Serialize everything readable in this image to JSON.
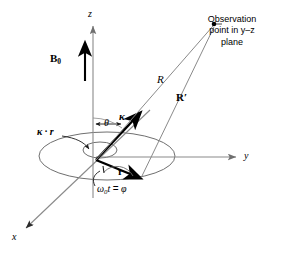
{
  "figure": {
    "background": "#ffffff",
    "ink": "#000000",
    "thin_line_color": "#7a7a7a",
    "width": 284,
    "height": 253
  },
  "axes": [
    {
      "name": "z-axis",
      "label": "z",
      "direction": "up",
      "tip": [
        93,
        22
      ]
    },
    {
      "name": "y-axis",
      "label": "y",
      "direction": "right",
      "tip": [
        238,
        157
      ]
    },
    {
      "name": "x-axis",
      "label": "x",
      "direction": "down-left",
      "tip": [
        24,
        230
      ]
    }
  ],
  "vectors": [
    {
      "name": "B0",
      "label": "B",
      "subscript": "0",
      "style": "bold",
      "description": "static magnetic field along z"
    },
    {
      "name": "kappa",
      "label": "κ",
      "style": "bold-italic",
      "description": "wave vector at angle theta from z"
    },
    {
      "name": "r",
      "label": "r",
      "style": "bold",
      "description": "position vector of charge in x-y plane"
    },
    {
      "name": "R",
      "label": "R",
      "style": "italic",
      "description": "distance to observation point"
    },
    {
      "name": "Rprime",
      "label": "R′",
      "style": "bold",
      "description": "vector to observation point"
    }
  ],
  "angles": [
    {
      "name": "theta",
      "label": "θ",
      "between": "z-axis and kappa"
    },
    {
      "name": "phi",
      "label": "ω",
      "subscript": "0",
      "var": "t",
      "equals": "=",
      "value": "φ",
      "text": "ω0t = φ",
      "between": "x-axis and r"
    }
  ],
  "annotations": [
    {
      "name": "kappa-dot-r",
      "label": "κ · r",
      "description": "phase term leader pointing to inner arc at origin"
    }
  ],
  "observation_point": {
    "name": "observation-point",
    "marker": [
      214,
      24
    ],
    "lines": [
      "Observation",
      "point in y–z",
      "plane"
    ]
  },
  "plane": {
    "name": "orbit-ellipse",
    "description": "circular orbit of the charge in the x-y plane drawn in perspective"
  }
}
